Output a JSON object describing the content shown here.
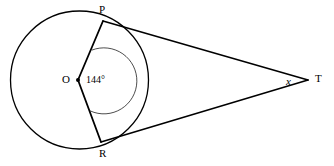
{
  "figure": {
    "type": "geometry-diagram",
    "width": 334,
    "height": 166,
    "background_color": "#ffffff",
    "stroke_color": "#000000"
  },
  "labels": {
    "center": "O",
    "tangent_point_top": "P",
    "tangent_point_bottom": "R",
    "external_point": "T",
    "unknown_angle": "x",
    "central_angle": "144°"
  },
  "geometry": {
    "circle": {
      "cx": 79.5,
      "cy": 80,
      "r": 69,
      "stroke_width": 1.3
    },
    "center_dot": {
      "cx": 78,
      "cy": 80,
      "r": 2.0
    },
    "points": {
      "P": {
        "x": 103,
        "y": 21
      },
      "R": {
        "x": 101,
        "y": 142
      },
      "T": {
        "x": 308,
        "y": 80
      },
      "O": {
        "x": 78,
        "y": 80
      }
    },
    "segments": [
      {
        "name": "radius-OP",
        "x1": 78,
        "y1": 80,
        "x2": 103,
        "y2": 21,
        "stroke_width": 1.8
      },
      {
        "name": "radius-OR",
        "x1": 78,
        "y1": 80,
        "x2": 101,
        "y2": 142,
        "stroke_width": 1.8
      },
      {
        "name": "tangent-PT",
        "x1": 103,
        "y1": 21,
        "x2": 308,
        "y2": 80,
        "stroke_width": 1.6
      },
      {
        "name": "tangent-RT",
        "x1": 101,
        "y1": 142,
        "x2": 308,
        "y2": 80,
        "stroke_width": 1.6
      }
    ],
    "angle_arc": {
      "name": "central-angle-arc",
      "cx": 78,
      "cy": 80,
      "r": 33,
      "start_x": 91.9,
      "start_y": 50.1,
      "end_x": 90.2,
      "end_y": 110.9,
      "large_arc": 1,
      "sweep": 1,
      "stroke_width": 0.7,
      "value_degrees": 144
    }
  }
}
